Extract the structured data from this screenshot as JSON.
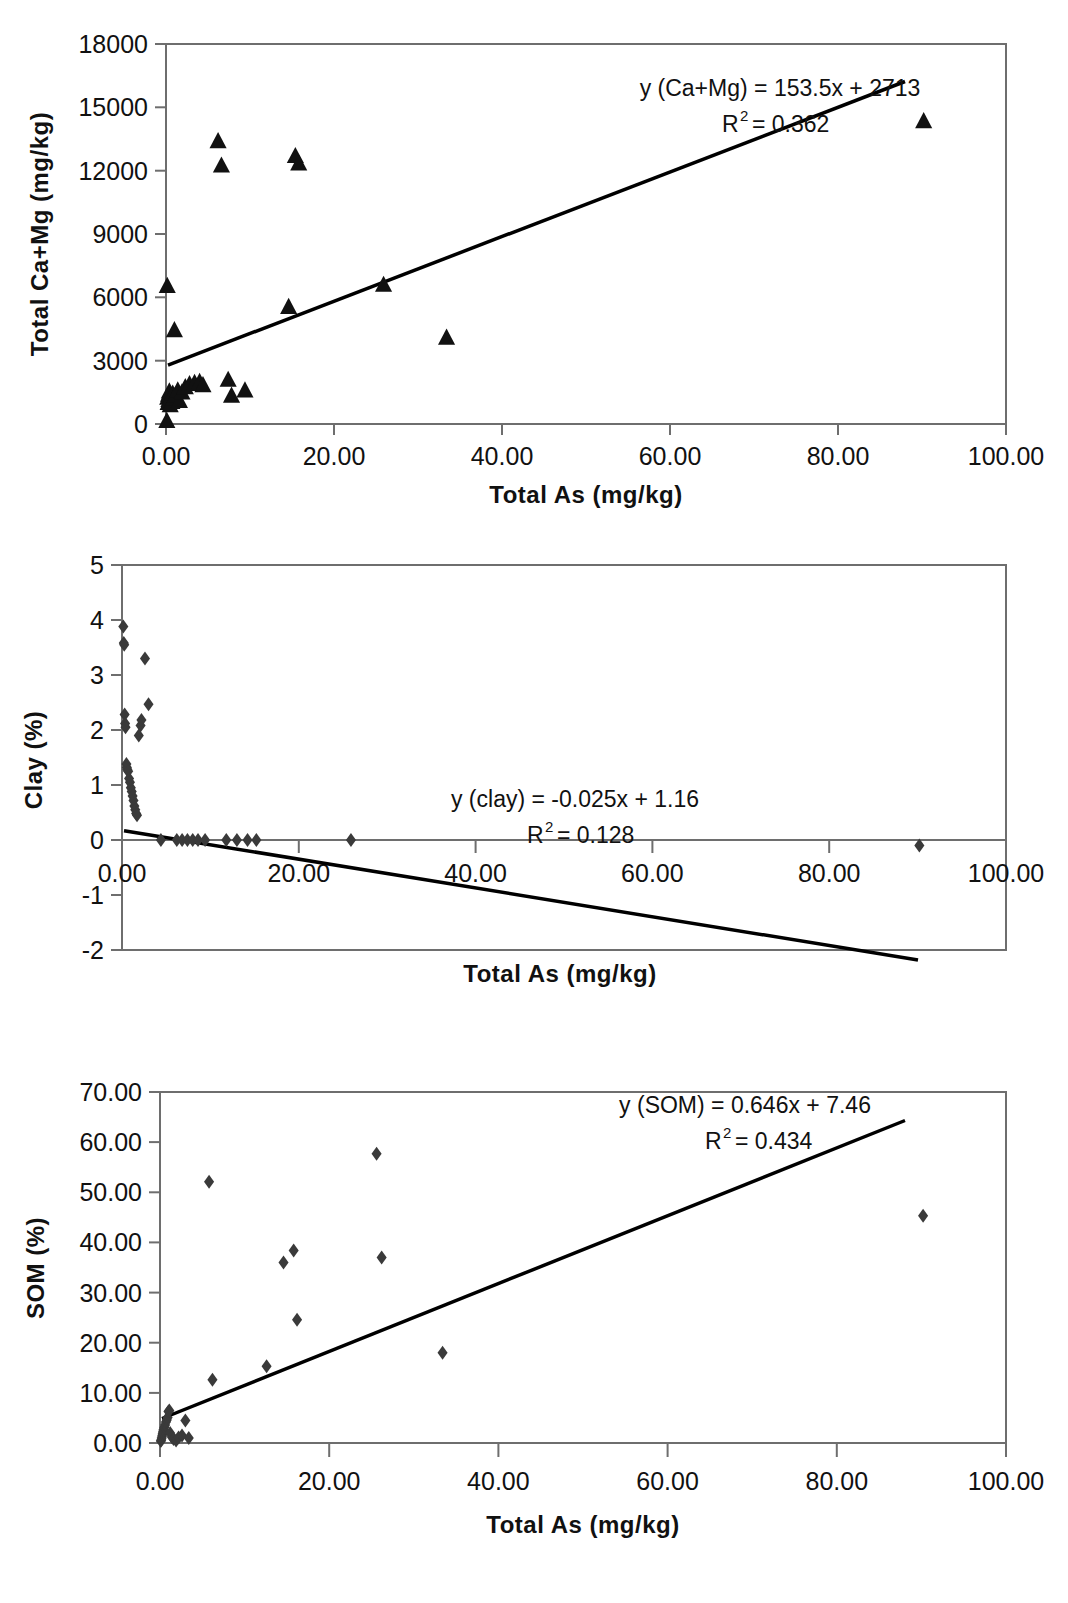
{
  "figure": {
    "name": "three-scatter-panels-total-as-correlations",
    "background": "#ffffff",
    "marker_color": "#1a1a1a",
    "line_color": "#000000",
    "axis_color": "#666666"
  },
  "panels": [
    {
      "id": "panel-ca-mg",
      "xlabel": "Total As (mg/kg)",
      "ylabel": "Total Ca+Mg (mg/kg)",
      "equation_main": "y (Ca+Mg) = 153.5x + 2713",
      "equation_r2_prefix": "R",
      "equation_r2_sup": "2",
      "equation_r2_value": "= 0.362",
      "xticks": [
        "0.00",
        "20.00",
        "40.00",
        "60.00",
        "80.00",
        "100.00"
      ],
      "yticks": [
        "0",
        "3000",
        "6000",
        "9000",
        "12000",
        "15000",
        "18000"
      ]
    },
    {
      "id": "panel-clay",
      "xlabel": "Total As (mg/kg)",
      "ylabel": "Clay (%)",
      "equation_main": "y (clay) = -0.025x + 1.16",
      "equation_r2_prefix": "R",
      "equation_r2_sup": "2",
      "equation_r2_value": "= 0.128",
      "xticks": [
        "0.00",
        "20.00",
        "40.00",
        "60.00",
        "80.00",
        "100.00"
      ],
      "yticks": [
        "-2",
        "-1",
        "0",
        "1",
        "2",
        "3",
        "4",
        "5"
      ]
    },
    {
      "id": "panel-som",
      "xlabel": "Total As (mg/kg)",
      "ylabel": "SOM (%)",
      "equation_main": "y (SOM) = 0.646x + 7.46",
      "equation_r2_prefix": "R",
      "equation_r2_sup": "2",
      "equation_r2_value": "= 0.434",
      "xticks": [
        "0.00",
        "20.00",
        "40.00",
        "60.00",
        "80.00",
        "100.00"
      ],
      "yticks": [
        "0.00",
        "10.00",
        "20.00",
        "30.00",
        "40.00",
        "50.00",
        "60.00",
        "70.00"
      ]
    }
  ],
  "chart_data": [
    {
      "type": "scatter",
      "title": "",
      "xlabel": "Total As (mg/kg)",
      "ylabel": "Total Ca+Mg (mg/kg)",
      "xlim": [
        0,
        100
      ],
      "ylim": [
        0,
        18000
      ],
      "xticks": [
        0,
        20,
        40,
        60,
        80,
        100
      ],
      "yticks": [
        0,
        3000,
        6000,
        9000,
        12000,
        15000,
        18000
      ],
      "grid": false,
      "legend": "none",
      "marker": "triangle",
      "series": [
        {
          "name": "Total Ca+Mg",
          "points": [
            [
              0.1,
              150
            ],
            [
              0.15,
              6550
            ],
            [
              0.2,
              1250
            ],
            [
              0.25,
              1000
            ],
            [
              0.3,
              1400
            ],
            [
              0.35,
              1150
            ],
            [
              0.4,
              1550
            ],
            [
              0.5,
              900
            ],
            [
              0.6,
              1300
            ],
            [
              0.7,
              1050
            ],
            [
              0.8,
              1450
            ],
            [
              0.9,
              1200
            ],
            [
              1.0,
              4450
            ],
            [
              1.1,
              1350
            ],
            [
              1.4,
              1600
            ],
            [
              1.6,
              1100
            ],
            [
              1.9,
              1500
            ],
            [
              2.3,
              1750
            ],
            [
              2.8,
              1900
            ],
            [
              3.4,
              1950
            ],
            [
              4.0,
              2000
            ],
            [
              4.4,
              1850
            ],
            [
              6.2,
              13400
            ],
            [
              6.6,
              12250
            ],
            [
              7.4,
              2100
            ],
            [
              7.8,
              1350
            ],
            [
              9.4,
              1600
            ],
            [
              14.6,
              5550
            ],
            [
              15.4,
              12700
            ],
            [
              15.8,
              12350
            ],
            [
              25.9,
              6600
            ],
            [
              33.4,
              4100
            ],
            [
              90.2,
              14350
            ]
          ]
        }
      ],
      "trendline": {
        "slope": 153.5,
        "intercept": 2713,
        "equation": "y (Ca+Mg) = 153.5x + 2713",
        "r2": 0.362
      }
    },
    {
      "type": "scatter",
      "title": "",
      "xlabel": "Total As (mg/kg)",
      "ylabel": "Clay (%)",
      "xlim": [
        0,
        100
      ],
      "ylim": [
        -2,
        5
      ],
      "xticks": [
        0,
        20,
        40,
        60,
        80,
        100
      ],
      "yticks": [
        -2,
        -1,
        0,
        1,
        2,
        3,
        4,
        5
      ],
      "grid": false,
      "legend": "none",
      "marker": "diamond",
      "series": [
        {
          "name": "Clay",
          "points": [
            [
              0.15,
              3.88
            ],
            [
              0.2,
              3.58
            ],
            [
              0.25,
              3.55
            ],
            [
              0.3,
              2.28
            ],
            [
              0.35,
              2.12
            ],
            [
              0.4,
              2.05
            ],
            [
              0.5,
              1.38
            ],
            [
              0.55,
              1.32
            ],
            [
              0.6,
              1.28
            ],
            [
              0.7,
              1.25
            ],
            [
              0.8,
              1.12
            ],
            [
              0.9,
              1.05
            ],
            [
              1.0,
              0.95
            ],
            [
              1.1,
              0.88
            ],
            [
              1.2,
              0.8
            ],
            [
              1.3,
              0.72
            ],
            [
              1.4,
              0.62
            ],
            [
              1.5,
              0.55
            ],
            [
              1.6,
              0.48
            ],
            [
              1.7,
              0.45
            ],
            [
              1.9,
              1.9
            ],
            [
              2.1,
              2.08
            ],
            [
              2.2,
              2.18
            ],
            [
              2.6,
              3.3
            ],
            [
              3.0,
              2.47
            ],
            [
              4.4,
              0.0
            ],
            [
              6.2,
              0.0
            ],
            [
              6.8,
              0.0
            ],
            [
              7.4,
              0.0
            ],
            [
              8.0,
              0.0
            ],
            [
              8.6,
              0.0
            ],
            [
              9.4,
              0.0
            ],
            [
              11.8,
              0.0
            ],
            [
              13.0,
              0.0
            ],
            [
              14.2,
              0.0
            ],
            [
              15.2,
              0.0
            ],
            [
              25.9,
              0.0
            ],
            [
              90.2,
              -0.1
            ]
          ]
        }
      ],
      "trendline": {
        "slope": -0.025,
        "intercept": 1.16,
        "equation": "y (clay) = -0.025x + 1.16",
        "r2": 0.128
      }
    },
    {
      "type": "scatter",
      "title": "",
      "xlabel": "Total As (mg/kg)",
      "ylabel": "SOM (%)",
      "xlim": [
        0,
        100
      ],
      "ylim": [
        0,
        70
      ],
      "xticks": [
        0,
        20,
        40,
        60,
        80,
        100
      ],
      "yticks": [
        0,
        10,
        20,
        30,
        40,
        50,
        60,
        70
      ],
      "grid": false,
      "legend": "none",
      "marker": "diamond",
      "series": [
        {
          "name": "SOM",
          "points": [
            [
              0.1,
              0.4
            ],
            [
              0.15,
              0.6
            ],
            [
              0.2,
              1.0
            ],
            [
              0.25,
              1.4
            ],
            [
              0.3,
              1.8
            ],
            [
              0.35,
              2.2
            ],
            [
              0.4,
              2.6
            ],
            [
              0.5,
              3.1
            ],
            [
              0.6,
              3.6
            ],
            [
              0.7,
              4.2
            ],
            [
              0.8,
              4.6
            ],
            [
              0.9,
              5.1
            ],
            [
              1.0,
              6.3
            ],
            [
              1.1,
              6.5
            ],
            [
              1.2,
              2.0
            ],
            [
              1.4,
              1.2
            ],
            [
              1.6,
              0.8
            ],
            [
              1.9,
              0.5
            ],
            [
              2.2,
              1.1
            ],
            [
              2.6,
              1.5
            ],
            [
              3.0,
              4.5
            ],
            [
              3.4,
              1.0
            ],
            [
              5.8,
              52.1
            ],
            [
              6.2,
              12.6
            ],
            [
              12.6,
              15.3
            ],
            [
              14.6,
              36.0
            ],
            [
              15.8,
              38.4
            ],
            [
              16.2,
              24.6
            ],
            [
              25.6,
              57.7
            ],
            [
              26.2,
              37.0
            ],
            [
              33.4,
              18.0
            ],
            [
              90.2,
              45.3
            ]
          ]
        }
      ],
      "trendline": {
        "slope": 0.646,
        "intercept": 7.46,
        "equation": "y (SOM) = 0.646x + 7.46",
        "r2": 0.434
      }
    }
  ]
}
